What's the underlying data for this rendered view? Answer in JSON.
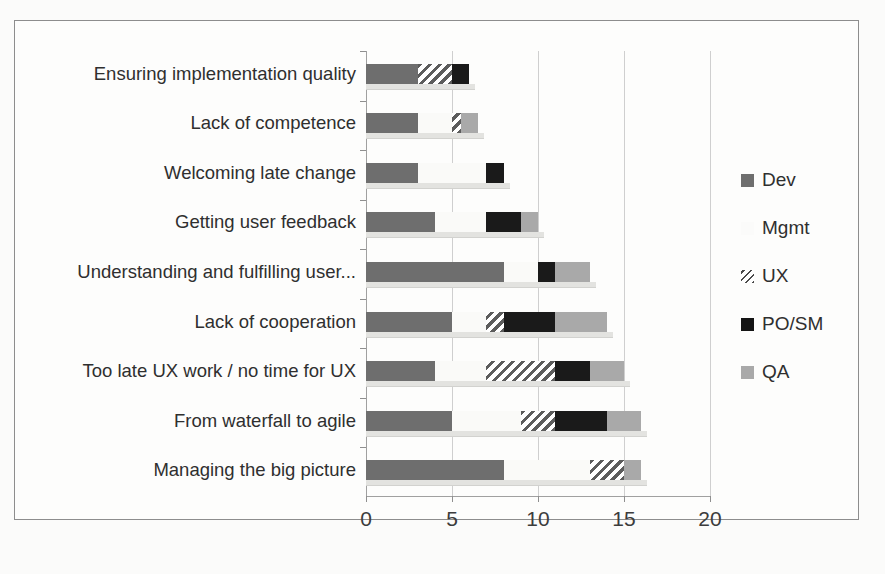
{
  "chart_data": {
    "type": "bar",
    "orientation": "horizontal",
    "stacked": true,
    "title": "",
    "xlabel": "",
    "ylabel": "",
    "xlim": [
      0,
      20
    ],
    "xticks": [
      0,
      5,
      10,
      15,
      20
    ],
    "xtick_labels": [
      "0",
      "5",
      "10",
      "15",
      "20"
    ],
    "grid": true,
    "legend_position": "right",
    "categories": [
      "Ensuring implementation quality",
      "Lack of competence",
      "Welcoming late change",
      "Getting user feedback",
      "Understanding and fulfilling user...",
      "Lack of cooperation",
      "Too late UX work / no time for UX",
      "From waterfall to agile",
      "Managing the big picture"
    ],
    "series": [
      {
        "name": "Dev",
        "color": "#6e6e6e",
        "values": [
          3,
          3,
          3,
          4,
          8,
          5,
          4,
          5,
          8
        ]
      },
      {
        "name": "Mgmt",
        "color": "#fafaf8",
        "values": [
          0,
          2,
          4,
          3,
          2,
          2,
          3,
          4,
          5
        ]
      },
      {
        "name": "UX",
        "color": "#5c5c5c",
        "pattern": "diagonal-hatch",
        "values": [
          2,
          0.5,
          0,
          0,
          0,
          1,
          4,
          2,
          2
        ]
      },
      {
        "name": "PO/SM",
        "color": "#1a1a1a",
        "values": [
          1,
          0,
          1,
          2,
          1,
          3,
          2,
          3,
          0
        ]
      },
      {
        "name": "QA",
        "color": "#a9a9a9",
        "values": [
          0,
          1,
          0,
          1,
          2,
          3,
          2,
          2,
          1
        ]
      }
    ],
    "totals": [
      6,
      6.5,
      8,
      10,
      13,
      14,
      15,
      16,
      16
    ]
  },
  "legend": {
    "items": [
      {
        "label": "Dev",
        "swatch_class": "sw-dev",
        "icon": "legend-swatch-dev"
      },
      {
        "label": "Mgmt",
        "swatch_class": "sw-mgmt",
        "icon": "legend-swatch-mgmt"
      },
      {
        "label": "UX",
        "swatch_class": "sw-ux",
        "icon": "legend-swatch-ux"
      },
      {
        "label": "PO/SM",
        "swatch_class": "sw-po",
        "icon": "legend-swatch-po-sm"
      },
      {
        "label": "QA",
        "swatch_class": "sw-qa",
        "icon": "legend-swatch-qa"
      }
    ]
  },
  "colors": {
    "dev": "#6e6e6e",
    "mgmt": "#fafaf8",
    "ux": "#5c5c5c",
    "po_sm": "#1a1a1a",
    "qa": "#a9a9a9",
    "axis": "#8f8f8f",
    "grid": "#cfcfcf",
    "frame": "#8d8d8d",
    "text": "#2f2f2f"
  }
}
